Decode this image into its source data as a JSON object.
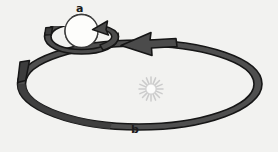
{
  "figure": {
    "name": "planet-rotation-and-revolution-diagram",
    "background_color": "#f2f2f0",
    "labels": {
      "rotation_label": "a",
      "revolution_label": "b"
    },
    "colors": {
      "band_fill": "#4f4f4f",
      "band_fill_dark": "#3a3a3a",
      "band_outline": "#1a1a1a",
      "planet_fill": "#fdfdfb",
      "planet_outline": "#3b3b3b",
      "sun_color": "#cfcfcf",
      "label_color": "#1c1c1c"
    },
    "elements": {
      "planet": "planet-circle",
      "rotation_arrow": "rotation-arrow-band",
      "orbit_arrow": "orbit-arrow-band",
      "sun": "sun-starburst"
    }
  }
}
